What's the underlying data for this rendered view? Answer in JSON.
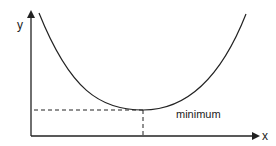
{
  "diagram": {
    "title": "",
    "axes": {
      "x_label": "x",
      "y_label": "y"
    },
    "curve": {
      "shape": "parabola",
      "description": "U-shaped convex curve"
    },
    "annotation": {
      "label": "minimum"
    },
    "colors": {
      "stroke": "#222222",
      "background": "#ffffff"
    }
  }
}
